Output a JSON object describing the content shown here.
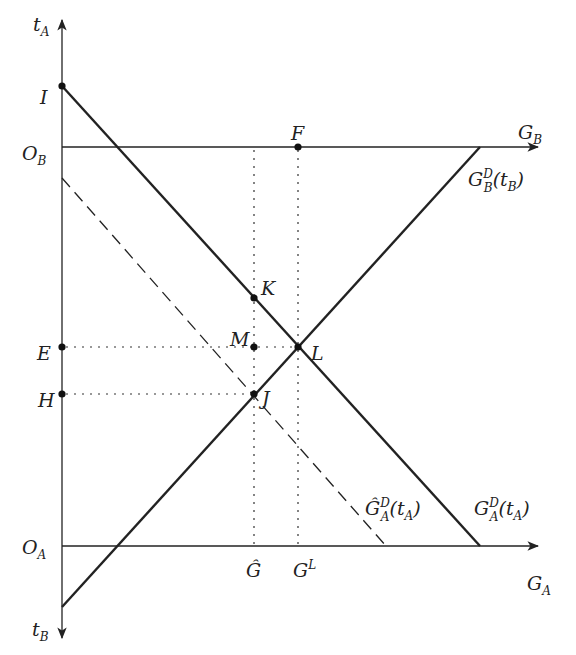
{
  "diagram": {
    "axes": {
      "vertical_top": {
        "label": "t",
        "sub": "A"
      },
      "vertical_bottom": {
        "label": "t",
        "sub": "B"
      },
      "horizontal_top": {
        "label": "G",
        "sub": "B",
        "origin": {
          "label": "O",
          "sub": "B"
        }
      },
      "horizontal_bottom": {
        "label": "G",
        "sub": "A",
        "origin": {
          "label": "O",
          "sub": "A"
        }
      }
    },
    "curves": {
      "demand_A": {
        "label": "G",
        "sup": "D",
        "sub": "A",
        "arg": "(t",
        "arg_sub": "A",
        "arg_close": ")"
      },
      "demand_A_hat": {
        "label": "Ĝ",
        "sup": "D",
        "sub": "A",
        "arg": "(t",
        "arg_sub": "A",
        "arg_close": ")"
      },
      "demand_B": {
        "label": "G",
        "sup": "D",
        "sub": "B",
        "arg": "(t",
        "arg_sub": "B",
        "arg_close": ")"
      }
    },
    "points": {
      "I": "I",
      "E": "E",
      "H": "H",
      "F": "F",
      "K": "K",
      "M": "M",
      "L": "L",
      "J": "J"
    },
    "ticks": {
      "g_hat": "Ĝ",
      "g_L": {
        "label": "G",
        "sup": "L"
      }
    },
    "colors": {
      "line": "#222222",
      "background": "#ffffff"
    }
  }
}
